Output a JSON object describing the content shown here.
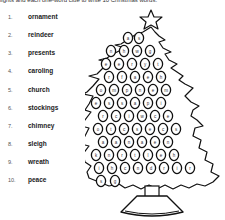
{
  "instructions": "lights and each one-word clue to write 10 Christmas words.",
  "words": [
    {
      "num": "1.",
      "word": "ornament"
    },
    {
      "num": "2.",
      "word": "reindeer"
    },
    {
      "num": "3.",
      "word": "presents"
    },
    {
      "num": "4.",
      "word": "caroling"
    },
    {
      "num": "5.",
      "word": "church"
    },
    {
      "num": "6.",
      "word": "stockings"
    },
    {
      "num": "7.",
      "word": "chimney"
    },
    {
      "num": "8.",
      "word": "sleigh"
    },
    {
      "num": "9.",
      "word": "wreath"
    },
    {
      "num": "10.",
      "word": "peace"
    }
  ],
  "tree": {
    "icons": [
      "star-icon",
      "christmas-tree-icon",
      "ornament-bulb-icon",
      "tree-stand-icon"
    ],
    "ornaments": [
      {
        "x": 37,
        "y": 25,
        "l": "a"
      },
      {
        "x": 48,
        "y": 25,
        "l": "s"
      },
      {
        "x": 20,
        "y": 38,
        "l": "n"
      },
      {
        "x": 33,
        "y": 38,
        "l": "h"
      },
      {
        "x": 46,
        "y": 38,
        "l": "w"
      },
      {
        "x": 59,
        "y": 38,
        "l": "g"
      },
      {
        "x": 15,
        "y": 51,
        "l": "e"
      },
      {
        "x": 28,
        "y": 51,
        "l": "e"
      },
      {
        "x": 41,
        "y": 51,
        "l": "r"
      },
      {
        "x": 54,
        "y": 51,
        "l": "y"
      },
      {
        "x": 67,
        "y": 51,
        "l": "t"
      },
      {
        "x": 18,
        "y": 64,
        "l": "r"
      },
      {
        "x": 31,
        "y": 64,
        "l": "f"
      },
      {
        "x": 44,
        "y": 64,
        "l": "a"
      },
      {
        "x": 57,
        "y": 64,
        "l": "e"
      },
      {
        "x": 70,
        "y": 64,
        "l": "h"
      },
      {
        "x": 10,
        "y": 77,
        "l": "o"
      },
      {
        "x": 23,
        "y": 77,
        "l": "m"
      },
      {
        "x": 36,
        "y": 77,
        "l": "p"
      },
      {
        "x": 49,
        "y": 77,
        "l": "n"
      },
      {
        "x": 62,
        "y": 77,
        "l": "e"
      },
      {
        "x": 75,
        "y": 77,
        "l": "m"
      },
      {
        "x": 5,
        "y": 90,
        "l": "e"
      },
      {
        "x": 18,
        "y": 90,
        "l": "s"
      },
      {
        "x": 31,
        "y": 90,
        "l": "s"
      },
      {
        "x": 44,
        "y": 90,
        "l": "a"
      },
      {
        "x": 57,
        "y": 90,
        "l": "p"
      },
      {
        "x": 70,
        "y": 90,
        "l": "i"
      },
      {
        "x": 12,
        "y": 103,
        "l": "r"
      },
      {
        "x": 25,
        "y": 103,
        "l": "c"
      },
      {
        "x": 38,
        "y": 103,
        "l": "i"
      },
      {
        "x": 51,
        "y": 103,
        "l": "w"
      },
      {
        "x": 64,
        "y": 103,
        "l": "c"
      },
      {
        "x": 77,
        "y": 103,
        "l": "e"
      },
      {
        "x": 7,
        "y": 116,
        "l": "o"
      },
      {
        "x": 20,
        "y": 116,
        "l": "t"
      },
      {
        "x": 33,
        "y": 116,
        "l": "c"
      },
      {
        "x": 46,
        "y": 116,
        "l": "s"
      },
      {
        "x": 59,
        "y": 116,
        "l": "e"
      },
      {
        "x": 72,
        "y": 116,
        "l": "c"
      },
      {
        "x": 85,
        "y": 116,
        "l": "s"
      },
      {
        "x": 12,
        "y": 129,
        "l": "a"
      },
      {
        "x": 25,
        "y": 129,
        "l": "a"
      },
      {
        "x": 38,
        "y": 129,
        "l": "n"
      },
      {
        "x": 51,
        "y": 129,
        "l": "a"
      },
      {
        "x": 64,
        "y": 129,
        "l": "e"
      },
      {
        "x": 77,
        "y": 129,
        "l": "n"
      },
      {
        "x": 5,
        "y": 142,
        "l": "k"
      },
      {
        "x": 18,
        "y": 142,
        "l": "n"
      },
      {
        "x": 31,
        "y": 142,
        "l": "r"
      },
      {
        "x": 44,
        "y": 142,
        "l": "t"
      },
      {
        "x": 57,
        "y": 142,
        "l": "l"
      },
      {
        "x": 70,
        "y": 142,
        "l": "e"
      },
      {
        "x": 83,
        "y": 142,
        "l": "h"
      },
      {
        "x": 8,
        "y": 155,
        "l": "i"
      },
      {
        "x": 21,
        "y": 155,
        "l": "h"
      },
      {
        "x": 34,
        "y": 155,
        "l": "c"
      },
      {
        "x": 47,
        "y": 155,
        "l": "n"
      },
      {
        "x": 60,
        "y": 155,
        "l": "d"
      },
      {
        "x": 73,
        "y": 155,
        "l": "r"
      },
      {
        "x": 86,
        "y": 155,
        "l": "i"
      },
      {
        "x": 99,
        "y": 155,
        "l": "r"
      },
      {
        "x": 10,
        "y": 168,
        "l": "s"
      },
      {
        "x": 24,
        "y": 168,
        "l": "g"
      }
    ]
  }
}
